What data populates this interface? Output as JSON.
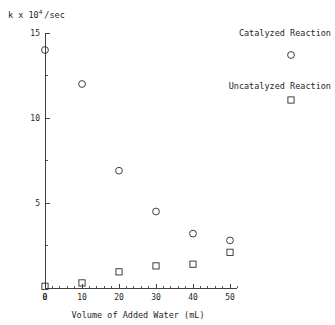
{
  "chart_data": {
    "type": "scatter",
    "title": "",
    "xlabel": "Volume of Added Water (mL)",
    "ylabel": "k x 10",
    "ylabel_exponent": "4",
    "ylabel_suffix": "/sec",
    "xlim": [
      0,
      52
    ],
    "ylim": [
      0,
      15
    ],
    "grid": false,
    "legend_position": "top-right",
    "x_ticks": [
      0,
      10,
      20,
      30,
      40,
      50
    ],
    "x_tick_labels": [
      "0",
      "10",
      "20",
      "30",
      "40",
      "50"
    ],
    "x_minor_step": 2,
    "y_ticks": [
      0,
      5,
      10,
      15
    ],
    "y_tick_labels": [
      "0",
      "5",
      "10",
      "15"
    ],
    "y_minor_step": 2.5,
    "series": [
      {
        "name": "Catalyzed Reaction",
        "marker": "circle",
        "x": [
          0,
          10,
          20,
          30,
          40,
          50
        ],
        "values": [
          14.0,
          12.0,
          6.9,
          4.5,
          3.2,
          2.8
        ]
      },
      {
        "name": "Uncatalyzed Reaction",
        "marker": "square",
        "x": [
          0,
          10,
          20,
          30,
          40,
          50
        ],
        "values": [
          0.1,
          0.3,
          0.95,
          1.3,
          1.4,
          2.1
        ]
      }
    ],
    "legend": [
      {
        "label": "Catalyzed Reaction",
        "marker": "circle"
      },
      {
        "label": "Uncatalyzed Reaction",
        "marker": "square"
      }
    ]
  }
}
